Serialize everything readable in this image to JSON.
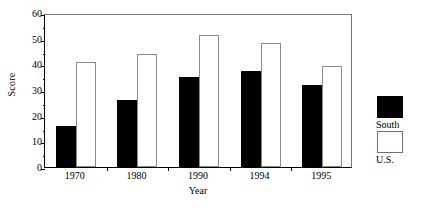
{
  "chart_data": {
    "type": "bar",
    "title": "",
    "xlabel": "Year",
    "ylabel": "Score",
    "categories": [
      "1970",
      "1980",
      "1990",
      "1994",
      "1995"
    ],
    "series": [
      {
        "name": "South",
        "values": [
          16,
          26,
          35,
          37.5,
          32
        ],
        "color": "#000000"
      },
      {
        "name": "U.S.",
        "values": [
          41,
          44,
          51.5,
          48.5,
          39.5
        ],
        "color": "#ffffff"
      }
    ],
    "ylim": [
      0,
      60
    ],
    "ytick_labels": [
      "0",
      "10",
      "20",
      "30",
      "40",
      "50",
      "60"
    ],
    "ytick_values": [
      0,
      10,
      20,
      30,
      40,
      50,
      60
    ],
    "yminor_values": [
      5,
      15,
      25,
      35,
      45,
      55
    ],
    "grid": false,
    "legend_position": "right-outside",
    "frame": true
  },
  "legend": {
    "items": [
      {
        "label": "South",
        "swatch": "filled-black-square"
      },
      {
        "label": "U.S.",
        "swatch": "open-white-square"
      }
    ]
  }
}
